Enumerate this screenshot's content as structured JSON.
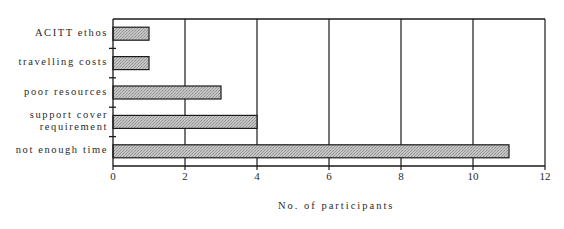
{
  "chart_data": {
    "type": "bar",
    "orientation": "horizontal",
    "title": "",
    "categories": [
      "ACITT ethos",
      "travelling costs",
      "poor resources",
      "support cover requirement",
      "not enough time"
    ],
    "category_labels": [
      [
        "ACITT ethos"
      ],
      [
        "travelling costs"
      ],
      [
        "poor resources"
      ],
      [
        "support cover",
        "requirement"
      ],
      [
        "not enough time"
      ]
    ],
    "values": [
      1,
      1,
      3,
      4,
      11
    ],
    "xlabel": "No. of participants",
    "ylabel": "",
    "xlim": [
      0,
      12
    ],
    "xticks": [
      "0",
      "2",
      "4",
      "6",
      "8",
      "10",
      "12"
    ],
    "grid": "vertical lines at each major tick",
    "legend": "none",
    "bar_fill": "stippled grey"
  },
  "colors": {
    "bar_fill": "#b8b8b8",
    "bar_border": "#1a1a1a",
    "axis": "#1a1a1a"
  }
}
